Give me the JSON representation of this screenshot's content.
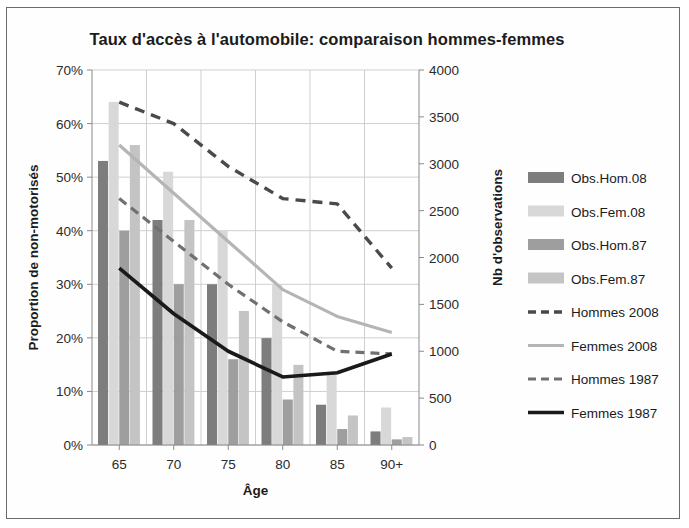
{
  "chart_data": {
    "type": "bar",
    "title": "Taux d'accès à l'automobile: comparaison hommes-femmes",
    "xlabel": "Âge",
    "ylabel": "Proportion de non-motorisés",
    "y2label": "Nb d'observations",
    "categories": [
      "65",
      "70",
      "75",
      "80",
      "85",
      "90+"
    ],
    "ylim": [
      0,
      0.7
    ],
    "yticks": [
      "0%",
      "10%",
      "20%",
      "30%",
      "40%",
      "50%",
      "60%",
      "70%"
    ],
    "ytick_values": [
      0,
      0.1,
      0.2,
      0.3,
      0.4,
      0.5,
      0.6,
      0.7
    ],
    "y2lim": [
      0,
      4000
    ],
    "y2ticks": [
      "0",
      "500",
      "1000",
      "1500",
      "2000",
      "2500",
      "3000",
      "3500",
      "4000"
    ],
    "y2tick_values": [
      0,
      500,
      1000,
      1500,
      2000,
      2500,
      3000,
      3500,
      4000
    ],
    "grid": true,
    "legend_position": "right",
    "bar_series": [
      {
        "name": "Obs.Hom.08",
        "axis": "right",
        "color": "#7d7d7d",
        "values": [
          3030,
          2400,
          1715,
          1140,
          430,
          145
        ]
      },
      {
        "name": "Obs.Fem.08",
        "axis": "right",
        "color": "#d8d8d8",
        "values": [
          3660,
          2915,
          2285,
          1715,
          770,
          400
        ]
      },
      {
        "name": "Obs.Hom.87",
        "axis": "right",
        "color": "#9e9e9e",
        "values": [
          2285,
          1715,
          915,
          485,
          170,
          60
        ]
      },
      {
        "name": "Obs.Fem.87",
        "axis": "right",
        "color": "#c4c4c4",
        "values": [
          3200,
          2400,
          1430,
          855,
          315,
          85
        ]
      }
    ],
    "line_series": [
      {
        "name": "Hommes 2008",
        "axis": "left",
        "color": "#4a4a4a",
        "dash": "10 7",
        "width": 3.4,
        "values": [
          0.64,
          0.6,
          0.52,
          0.46,
          0.45,
          0.33
        ]
      },
      {
        "name": "Femmes 2008",
        "axis": "left",
        "color": "#b5b5b5",
        "dash": "none",
        "width": 3.2,
        "values": [
          0.56,
          0.47,
          0.38,
          0.29,
          0.24,
          0.21
        ]
      },
      {
        "name": "Hommes 1987",
        "axis": "left",
        "color": "#707070",
        "dash": "9 6",
        "width": 3.2,
        "values": [
          0.46,
          0.38,
          0.3,
          0.23,
          0.175,
          0.17
        ]
      },
      {
        "name": "Femmes 1987",
        "axis": "left",
        "color": "#1a1a1a",
        "dash": "none",
        "width": 3.6,
        "values": [
          0.33,
          0.245,
          0.175,
          0.127,
          0.135,
          0.17
        ]
      }
    ]
  },
  "legend": {
    "items": [
      {
        "label": "Obs.Hom.08",
        "kind": "swatch"
      },
      {
        "label": "Obs.Fem.08",
        "kind": "swatch"
      },
      {
        "label": "Obs.Hom.87",
        "kind": "swatch"
      },
      {
        "label": "Obs.Fem.87",
        "kind": "swatch"
      },
      {
        "label": "Hommes 2008",
        "kind": "line"
      },
      {
        "label": "Femmes 2008",
        "kind": "line"
      },
      {
        "label": "Hommes 1987",
        "kind": "line"
      },
      {
        "label": "Femmes 1987",
        "kind": "line"
      }
    ]
  }
}
